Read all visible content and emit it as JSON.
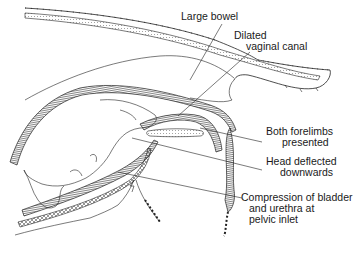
{
  "diagram": {
    "colors": {
      "ink": "#222222",
      "background": "#ffffff"
    },
    "labels": [
      {
        "id": "large-bowel",
        "lines": [
          "Large bowel"
        ]
      },
      {
        "id": "dilated-vaginal-canal",
        "lines": [
          "Dilated",
          "vaginal canal"
        ]
      },
      {
        "id": "both-forelimbs",
        "lines": [
          "Both forelimbs",
          "presented"
        ]
      },
      {
        "id": "head-deflected",
        "lines": [
          "Head deflected",
          "downwards"
        ]
      },
      {
        "id": "compression-bladder",
        "lines": [
          "Compression of bladder",
          "and urethra at",
          "pelvic inlet"
        ]
      }
    ]
  }
}
